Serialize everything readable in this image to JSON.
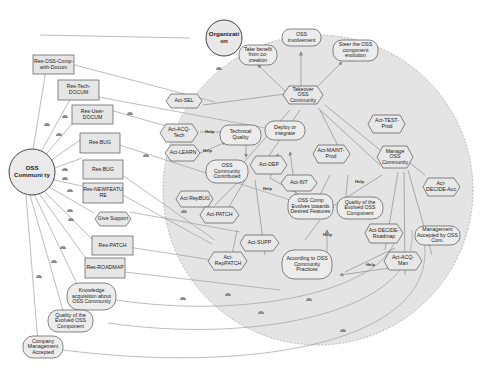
{
  "diagram": {
    "type": "i* strategic rationale model",
    "colors": {
      "boundary_fill": "#e4e4e4",
      "boundary_stroke": "#9a9a9a",
      "node_fill": "#e8e8e8",
      "node_stroke": "#555555",
      "link": "#9a9a9a"
    },
    "actors": [
      {
        "id": "organization",
        "label": "Organizati on"
      },
      {
        "id": "oss-community",
        "label": "OSS Communi ty"
      }
    ],
    "resources": [
      {
        "id": "res-oss-comp-with-docum",
        "label": "Res-OSS-Comp-with-Docum"
      },
      {
        "id": "res-tech-docum",
        "label": "Res-Tech-DOCUM"
      },
      {
        "id": "res-user-docum",
        "label": "Res-User-DOCUM"
      },
      {
        "id": "res-bug-1",
        "label": "Res-BUG"
      },
      {
        "id": "res-bug-2",
        "label": "Res-BUG"
      },
      {
        "id": "res-newfeature",
        "label": "Res-NEWFEATU RE"
      },
      {
        "id": "res-patch",
        "label": "Res-PATCH"
      },
      {
        "id": "res-roadmap",
        "label": "Res-ROADMAP"
      }
    ],
    "tasks": [
      {
        "id": "give-support",
        "label": "Give Support"
      },
      {
        "id": "act-sel",
        "label": "Act-SEL"
      },
      {
        "id": "act-acq-tech",
        "label": "Act-ACQ-Tech"
      },
      {
        "id": "act-learn",
        "label": "Act-LEARN"
      },
      {
        "id": "takeover",
        "label": "Takeover OSS Community"
      },
      {
        "id": "act-test-prod",
        "label": "Act-TEST-Prod"
      },
      {
        "id": "act-dep",
        "label": "Act-DEP"
      },
      {
        "id": "act-int",
        "label": "Act-INT"
      },
      {
        "id": "act-maint-prod",
        "label": "Act-MAINT-Prod"
      },
      {
        "id": "manage-oss",
        "label": "Manage OSS Community"
      },
      {
        "id": "act-decide-acc",
        "label": "Act-DECIDE-Acc"
      },
      {
        "id": "act-repbug",
        "label": "Act-RepBUG"
      },
      {
        "id": "act-patch",
        "label": "Act-PATCH"
      },
      {
        "id": "act-supp",
        "label": "Act-SUPP"
      },
      {
        "id": "act-reppatch",
        "label": "Act-RepPATCH"
      },
      {
        "id": "act-decide-roadmap",
        "label": "Act-DECIDE-Roadmap"
      },
      {
        "id": "act-acq-man",
        "label": "Act-ACQ-Man"
      }
    ],
    "softgoals": [
      {
        "id": "take-benefit",
        "label": "Take benefit from co-creation"
      },
      {
        "id": "oss-involvement",
        "label": "OSS involvement"
      },
      {
        "id": "steer",
        "label": "Steer the OSS component evolution"
      },
      {
        "id": "tech-quality",
        "label": "Technical Quality"
      },
      {
        "id": "deploy-integrate",
        "label": "Deploy or integrate"
      },
      {
        "id": "oss-contributed",
        "label": "OSS Community Contributed"
      },
      {
        "id": "oss-comp-evolves",
        "label": "OSS Comp Evolves towards Desired Features"
      },
      {
        "id": "quality-evolved-inner",
        "label": "Quality of the Evolved OSS Component"
      },
      {
        "id": "mgmt-accepted-inner",
        "label": "Management Accepted by OSS Com."
      },
      {
        "id": "according-practices",
        "label": "According to OSS Community Practices"
      },
      {
        "id": "knowledge-acq",
        "label": "Knowledge acquisition about OSS Community"
      },
      {
        "id": "quality-evolved-outer",
        "label": "Quality of the Evolved OSS Component"
      },
      {
        "id": "company-mgmt",
        "label": "Company Management Accepted"
      }
    ],
    "contribution_label": "Help"
  }
}
